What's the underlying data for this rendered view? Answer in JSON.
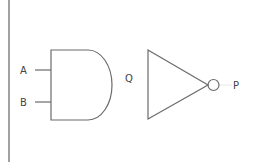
{
  "diagram": {
    "colors": {
      "stroke": "#6b6b6b",
      "label": "#444444",
      "background": "#ffffff"
    },
    "gates": [
      {
        "type": "AND",
        "inputs": [
          "A",
          "B"
        ],
        "output": "Q"
      },
      {
        "type": "NOT",
        "inputs": [
          "Q"
        ],
        "output": "P"
      }
    ],
    "labels": {
      "input_a": "A",
      "input_b": "B",
      "intermediate": "Q",
      "output": "P"
    }
  }
}
